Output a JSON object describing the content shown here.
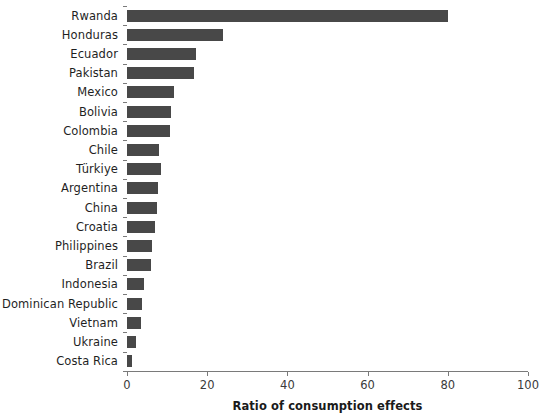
{
  "chart_data": {
    "type": "bar",
    "orientation": "horizontal",
    "title": "",
    "subtitle": "",
    "xlabel": "Ratio of consumption effects",
    "ylabel": "",
    "xlim": [
      0,
      100
    ],
    "xticks": [
      0,
      20,
      40,
      60,
      80,
      100
    ],
    "xtick_labels": [
      "0",
      "20",
      "40",
      "60",
      "80",
      "100"
    ],
    "grid": false,
    "legend": null,
    "bar_color": "#484848",
    "axis_color": "#7a7a7a",
    "categories": [
      "Rwanda",
      "Honduras",
      "Ecuador",
      "Pakistan",
      "Mexico",
      "Bolivia",
      "Colombia",
      "Chile",
      "Türkiye",
      "Argentina",
      "China",
      "Croatia",
      "Philippines",
      "Brazil",
      "Indonesia",
      "Dominican Republic",
      "Vietnam",
      "Ukraine",
      "Costa Rica"
    ],
    "values": [
      80.0,
      24.0,
      17.2,
      16.7,
      11.7,
      11.0,
      10.7,
      8.0,
      8.5,
      7.7,
      7.5,
      7.0,
      6.3,
      6.0,
      4.2,
      3.7,
      3.5,
      2.2,
      1.2
    ]
  }
}
